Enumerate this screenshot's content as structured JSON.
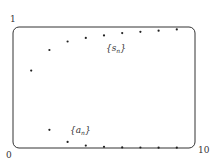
{
  "chart_data": {
    "type": "scatter",
    "title": "",
    "xlabel": "",
    "ylabel": "",
    "xlim": [
      0,
      10
    ],
    "ylim": [
      0,
      1
    ],
    "grid": false,
    "legend": "none",
    "tick_labels": {
      "x_min": "0",
      "x_max": "10",
      "y_max": "1"
    },
    "series": [
      {
        "name": "{s_n}",
        "label_main": "{s",
        "label_sub": "n",
        "label_close": "}",
        "x": [
          1,
          2,
          3,
          4,
          5,
          6,
          7,
          8,
          9
        ],
        "values": [
          0.64,
          0.81,
          0.88,
          0.91,
          0.93,
          0.95,
          0.96,
          0.97,
          0.98
        ]
      },
      {
        "name": "{a_n}",
        "label_main": "{a",
        "label_sub": "n",
        "label_close": "}",
        "x": [
          2,
          3,
          4,
          5,
          6,
          7,
          8,
          9
        ],
        "values": [
          0.15,
          0.05,
          0.02,
          0.01,
          0.005,
          0.004,
          0.003,
          0.003
        ]
      }
    ],
    "annotations": [
      {
        "text": "{s_n}",
        "x": 5.5,
        "y": 0.85
      },
      {
        "text": "{a_n}",
        "x": 3.2,
        "y": 0.15
      }
    ]
  }
}
